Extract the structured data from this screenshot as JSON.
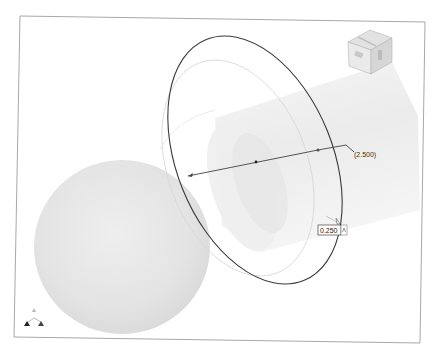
{
  "viewport": {
    "name": "3D modeling viewport",
    "background": "#ffffff",
    "frame_border_color": "#9a9a9a"
  },
  "viewcube": {
    "faces": [
      "TOP",
      "FRONT",
      "RIGHT"
    ],
    "face_labels_visible": [
      "FRONT",
      "RIGHT"
    ]
  },
  "sketch": {
    "circle_color": "#333333",
    "dimension_driven_label": "(2.500)",
    "edit_value": "0.250",
    "edit_value_icon": "dimension-unit-icon"
  },
  "bodies": {
    "sphere_color": "#e3e3e3",
    "cylinder_color": "#ededed"
  },
  "triad": {
    "axes": [
      "Z",
      "X",
      "Y"
    ],
    "icon": "axis-triad-icon"
  }
}
